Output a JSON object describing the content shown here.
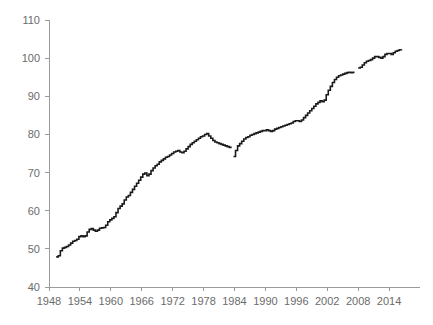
{
  "chart_data": {
    "type": "line",
    "title": "",
    "subtitle": "",
    "xlabel": "",
    "ylabel": "",
    "xlim": [
      1948,
      2020
    ],
    "ylim": [
      40,
      110
    ],
    "grid": false,
    "legend": false,
    "y_ticks": [
      40,
      50,
      60,
      70,
      80,
      90,
      100,
      110
    ],
    "y_tick_labels": [
      "40",
      "50",
      "60",
      "70",
      "80",
      "90",
      "100",
      "110"
    ],
    "x_ticks": [
      1948,
      1954,
      1960,
      1966,
      1972,
      1978,
      1984,
      1990,
      1996,
      2002,
      2008,
      2014
    ],
    "x_tick_labels": [
      "1948",
      "1954",
      "1960",
      "1966",
      "1972",
      "1978",
      "1984",
      "1990",
      "1996",
      "2002",
      "2008",
      "2014"
    ],
    "line_color": "#1a1a1a",
    "axis_color": "#9a9a9a",
    "tick_label_color": "#6b6b6b",
    "series": [
      {
        "name": "Index",
        "segment": 1,
        "x": [
          1949.4,
          1949.8,
          1950.2,
          1950.6,
          1951.0,
          1951.4,
          1951.8,
          1952.2,
          1952.6,
          1953.0,
          1953.4,
          1953.8,
          1954.2,
          1954.6,
          1955.0,
          1955.4,
          1955.8,
          1956.2,
          1956.6,
          1957.0,
          1957.4,
          1957.8,
          1958.2,
          1958.6,
          1959.0,
          1959.4,
          1959.8,
          1960.2,
          1960.6,
          1961.0,
          1961.4,
          1961.8,
          1962.2,
          1962.6,
          1963.0,
          1963.4,
          1963.8,
          1964.2,
          1964.6,
          1965.0,
          1965.4,
          1965.8,
          1966.2,
          1966.6,
          1967.0,
          1967.4,
          1967.8,
          1968.2,
          1968.6,
          1969.0,
          1969.4,
          1969.8,
          1970.2,
          1970.6,
          1971.0,
          1971.4,
          1971.8,
          1972.2,
          1972.6,
          1973.0,
          1973.4,
          1973.8,
          1974.2,
          1974.6,
          1975.0,
          1975.4,
          1975.8,
          1976.2,
          1976.6,
          1977.0,
          1977.4,
          1977.8,
          1978.2,
          1978.6,
          1979.0,
          1979.4,
          1979.8,
          1980.2,
          1980.6,
          1981.0,
          1981.4,
          1981.8,
          1982.2,
          1982.6,
          1983.0,
          1983.3
        ],
        "y": [
          47.9,
          48.2,
          49.5,
          50.2,
          50.4,
          50.6,
          51.0,
          51.5,
          52.0,
          52.2,
          52.5,
          53.2,
          53.4,
          53.2,
          53.4,
          54.4,
          55.1,
          55.3,
          54.9,
          54.6,
          54.9,
          55.4,
          55.5,
          55.6,
          56.2,
          57.1,
          57.6,
          58.0,
          58.4,
          59.5,
          60.6,
          61.2,
          61.8,
          62.8,
          63.6,
          64.0,
          64.8,
          65.6,
          66.4,
          67.2,
          68.0,
          68.8,
          69.6,
          69.9,
          69.2,
          69.6,
          70.5,
          71.2,
          71.8,
          72.2,
          72.8,
          73.2,
          73.6,
          74.0,
          74.2,
          74.6,
          75.0,
          75.4,
          75.6,
          75.8,
          75.4,
          75.2,
          75.6,
          76.2,
          76.8,
          77.4,
          77.8,
          78.2,
          78.6,
          79.0,
          79.4,
          79.6,
          80.0,
          80.2,
          79.6,
          79.0,
          78.4,
          78.0,
          77.8,
          77.6,
          77.4,
          77.2,
          77.0,
          76.8,
          76.6,
          76.4
        ]
      },
      {
        "name": "Index",
        "segment": 2,
        "x": [
          1983.8,
          1984.2,
          1984.6,
          1985.0,
          1985.4,
          1985.8,
          1986.2,
          1986.6,
          1987.0,
          1987.4,
          1987.8,
          1988.2,
          1988.6,
          1989.0,
          1989.4,
          1989.8,
          1990.2,
          1990.6,
          1991.0,
          1991.4,
          1991.8,
          1992.2,
          1992.6,
          1993.0,
          1993.4,
          1993.8,
          1994.2,
          1994.6,
          1995.0,
          1995.4,
          1995.8,
          1996.2,
          1996.6,
          1997.0,
          1997.4,
          1997.8,
          1998.2,
          1998.6,
          1999.0,
          1999.4,
          1999.8,
          2000.2,
          2000.6,
          2001.0,
          2001.4,
          2001.8,
          2002.2,
          2002.6,
          2003.0,
          2003.4,
          2003.8,
          2004.2,
          2004.6,
          2005.0,
          2005.4,
          2005.8,
          2006.2,
          2006.6,
          2007.0,
          2007.3
        ],
        "y": [
          74.2,
          75.8,
          77.0,
          77.6,
          78.2,
          78.8,
          79.2,
          79.4,
          79.8,
          80.0,
          80.2,
          80.4,
          80.6,
          80.8,
          81.0,
          81.0,
          81.2,
          81.0,
          80.8,
          81.0,
          81.4,
          81.6,
          81.8,
          82.0,
          82.2,
          82.4,
          82.6,
          82.8,
          83.0,
          83.4,
          83.6,
          83.6,
          83.4,
          83.8,
          84.4,
          85.0,
          85.6,
          86.2,
          86.8,
          87.4,
          88.0,
          88.4,
          88.8,
          88.6,
          89.0,
          90.4,
          91.6,
          92.6,
          93.6,
          94.4,
          95.0,
          95.4,
          95.6,
          95.8,
          96.0,
          96.2,
          96.3,
          96.2,
          96.3,
          96.3
        ]
      },
      {
        "name": "Index",
        "segment": 3,
        "x": [
          2008.0,
          2008.4,
          2008.8,
          2009.2,
          2009.6,
          2010.0,
          2010.4,
          2010.8,
          2011.2,
          2011.6,
          2012.0,
          2012.4,
          2012.8,
          2013.2,
          2013.6,
          2014.0,
          2014.4,
          2014.8,
          2015.2,
          2015.6,
          2016.0,
          2016.4
        ],
        "y": [
          97.4,
          97.6,
          98.2,
          98.8,
          99.2,
          99.4,
          99.6,
          100.0,
          100.4,
          100.4,
          100.2,
          100.0,
          100.4,
          101.0,
          101.2,
          101.2,
          101.0,
          101.4,
          101.8,
          102.0,
          102.2,
          102.3
        ]
      }
    ]
  }
}
